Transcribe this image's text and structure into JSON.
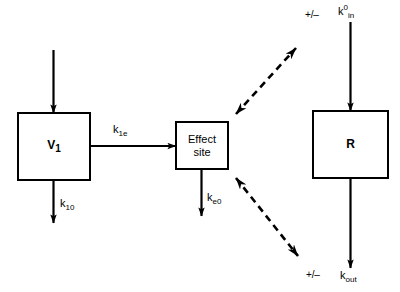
{
  "figure": {
    "type": "pk-pd-block-diagram",
    "background_color": "#ffffff",
    "stroke_color": "#000000"
  },
  "nodes": [
    {
      "id": "v1",
      "label": "V1",
      "label_text": "V",
      "label_sub": "1",
      "bold": true
    },
    {
      "id": "effect",
      "label": "Effect site",
      "line1": "Effect",
      "line2": "site",
      "bold": false
    },
    {
      "id": "r",
      "label": "R",
      "label_text": "R",
      "label_sub": "",
      "bold": true
    }
  ],
  "labels": {
    "v1_base": "V",
    "v1_sub": "1",
    "effect_line1": "Effect",
    "effect_line2": "site",
    "r": "R",
    "k1e_base": "k",
    "k1e_sub": "1e",
    "k10_base": "k",
    "k10_sub": "10",
    "ke0_base": "k",
    "ke0_sub": "e0",
    "kin_base": "k",
    "kin_sup": "0",
    "kin_sub": "in",
    "kout_base": "k",
    "kout_sub": "out",
    "plus_minus_top": "+/–",
    "plus_minus_bottom": "+/–"
  },
  "edges": [
    {
      "id": "input-to-v1",
      "from": "external",
      "to": "v1",
      "style": "solid",
      "arrowheads": "end",
      "label": ""
    },
    {
      "id": "v1-to-effect",
      "from": "v1",
      "to": "effect",
      "style": "solid",
      "arrowheads": "end",
      "label": "k1e"
    },
    {
      "id": "v1-elimination",
      "from": "v1",
      "to": "external",
      "style": "solid",
      "arrowheads": "end",
      "label": "k10"
    },
    {
      "id": "effect-elimination",
      "from": "effect",
      "to": "external",
      "style": "solid",
      "arrowheads": "end",
      "label": "ke0"
    },
    {
      "id": "effect-to-kin",
      "from": "effect",
      "to": "kin-site",
      "style": "dashed",
      "arrowheads": "both",
      "label": "+/–"
    },
    {
      "id": "effect-to-kout",
      "from": "effect",
      "to": "kout-site",
      "style": "dashed",
      "arrowheads": "both",
      "label": "+/–"
    },
    {
      "id": "kin-to-r",
      "from": "external",
      "to": "r",
      "style": "solid",
      "arrowheads": "end",
      "label": "k0in"
    },
    {
      "id": "r-to-kout",
      "from": "r",
      "to": "external",
      "style": "solid",
      "arrowheads": "end",
      "label": "kout"
    }
  ],
  "caption_margin": {
    "text": ""
  }
}
